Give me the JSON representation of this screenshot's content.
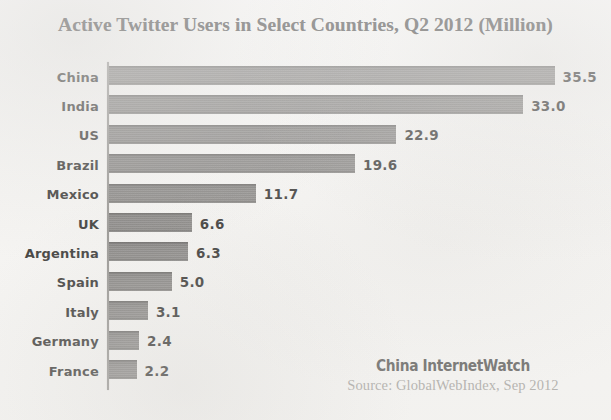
{
  "chart_data": {
    "type": "bar",
    "orientation": "horizontal",
    "title": "Active Twitter Users in Select Countries, Q2 2012 (Million)",
    "xlabel": "",
    "ylabel": "",
    "xlim": [
      0,
      35.5
    ],
    "grid": false,
    "legend": null,
    "axis_line": "vertical-left",
    "value_label_format": "one-decimal",
    "bar_color": "#7b7977",
    "background_color": "#f6f5f3",
    "categories": [
      "China",
      "India",
      "US",
      "Brazil",
      "Mexico",
      "UK",
      "Argentina",
      "Spain",
      "Italy",
      "Germany",
      "France"
    ],
    "values": [
      35.5,
      33.0,
      22.9,
      19.6,
      11.7,
      6.6,
      6.3,
      5.0,
      3.1,
      2.4,
      2.2
    ],
    "value_labels": [
      "35.5",
      "33.0",
      "22.9",
      "19.6",
      "11.7",
      "6.6",
      "6.3",
      "5.0",
      "3.1",
      "2.4",
      "2.2"
    ],
    "bars": [
      {
        "category": "China",
        "value": 35.5,
        "label": "35.5"
      },
      {
        "category": "India",
        "value": 33.0,
        "label": "33.0"
      },
      {
        "category": "US",
        "value": 22.9,
        "label": "22.9"
      },
      {
        "category": "Brazil",
        "value": 19.6,
        "label": "19.6"
      },
      {
        "category": "Mexico",
        "value": 11.7,
        "label": "11.7"
      },
      {
        "category": "UK",
        "value": 6.6,
        "label": "6.6"
      },
      {
        "category": "Argentina",
        "value": 6.3,
        "label": "6.3"
      },
      {
        "category": "Spain",
        "value": 5.0,
        "label": "5.0"
      },
      {
        "category": "Italy",
        "value": 3.1,
        "label": "3.1"
      },
      {
        "category": "Germany",
        "value": 2.4,
        "label": "2.4"
      },
      {
        "category": "France",
        "value": 2.2,
        "label": "2.2"
      }
    ],
    "annotations": {
      "watermark_brand": "China InternetWatch",
      "source": "Source: GlobalWebIndex, Sep 2012"
    }
  }
}
